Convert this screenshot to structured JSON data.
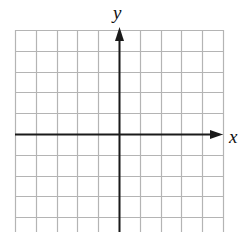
{
  "diagram": {
    "type": "coordinate-plane",
    "x_axis_label": "x",
    "y_axis_label": "y",
    "grid": {
      "columns": 10,
      "left": 15,
      "top": 30,
      "cell_size": 20.8,
      "rows_visible": 10,
      "origin_column": 5,
      "origin_row": 5,
      "line_color": "#b4b4b4"
    },
    "axis_color": "#1a1a1a"
  }
}
